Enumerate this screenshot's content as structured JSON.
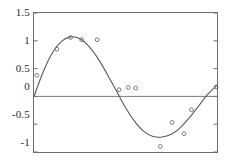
{
  "figure": {
    "background_color": "#ffffff",
    "frame_color": "#6e6e6e",
    "curve_color": "#5a5a5a",
    "marker_color": "#6b6b6b",
    "zero_line_color": "#7a7a7a",
    "tick_color": "#6e6e6e",
    "label_color": "#2b2b2b"
  },
  "chart_data": {
    "type": "scatter",
    "title": "",
    "subtitle": "",
    "xlabel": "",
    "ylabel": "",
    "xlim": [
      0,
      1
    ],
    "ylim": [
      -1,
      1.5
    ],
    "grid": false,
    "legend": null,
    "legend_position": "none",
    "x_tick_labels": [],
    "y_tick_labels": [
      "1.5",
      "1",
      "0.5",
      "0",
      "-0.5",
      "-1"
    ],
    "y_ticks": [
      1.5,
      1,
      0.5,
      0,
      -0.5,
      -1
    ],
    "x_ticks": [],
    "annotations": [
      {
        "name": "zero-reference-line",
        "y": 0
      }
    ],
    "series": [
      {
        "name": "data-points",
        "type": "scatter",
        "marker": "open-circle",
        "x": [
          0.015,
          0.125,
          0.2,
          0.26,
          0.345,
          0.465,
          0.515,
          0.555,
          0.69,
          0.755,
          0.82,
          0.86,
          0.995
        ],
        "y": [
          0.38,
          0.85,
          1.06,
          1.02,
          1.02,
          0.12,
          0.16,
          0.15,
          -0.9,
          -0.47,
          -0.67,
          -0.24,
          0.17
        ]
      },
      {
        "name": "fitted-curve",
        "type": "line",
        "description": "smooth sinusoidal fit",
        "x": [
          0.0,
          0.05,
          0.1,
          0.15,
          0.2,
          0.25,
          0.3,
          0.35,
          0.4,
          0.45,
          0.5,
          0.55,
          0.6,
          0.65,
          0.7,
          0.75,
          0.8,
          0.85,
          0.9,
          0.95,
          1.0
        ],
        "y": [
          0.0,
          0.44,
          0.78,
          0.99,
          1.07,
          1.04,
          0.9,
          0.68,
          0.4,
          0.1,
          -0.2,
          -0.45,
          -0.63,
          -0.72,
          -0.73,
          -0.68,
          -0.56,
          -0.38,
          -0.17,
          0.04,
          0.2
        ]
      }
    ]
  }
}
